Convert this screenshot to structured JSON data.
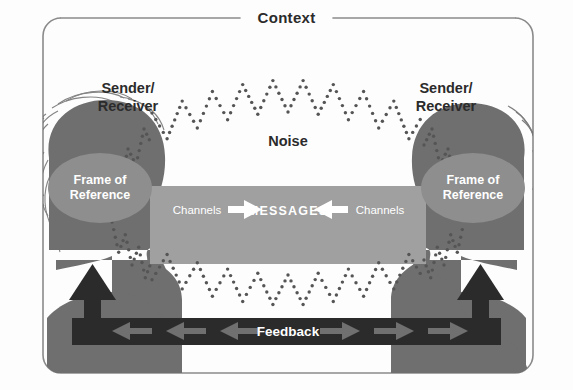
{
  "diagram": {
    "type": "communication-model"
  },
  "frame": {
    "context_label": "Context",
    "border_color": "#8a8a8a",
    "background_color": "#fdfdfd"
  },
  "left_person": {
    "role_label_line1": "Sender/",
    "role_label_line2": "Receiver",
    "frame_of_reference_line1": "Frame of",
    "frame_of_reference_line2": "Reference",
    "silhouette_color": "#6f6f6f",
    "ellipse_color": "#8e8e8e",
    "gender_hint": "long-hair-figure"
  },
  "right_person": {
    "role_label_line1": "Sender/",
    "role_label_line2": "Receiver",
    "frame_of_reference_line1": "Frame of",
    "frame_of_reference_line2": "Reference",
    "silhouette_color": "#6f6f6f",
    "ellipse_color": "#8e8e8e",
    "gender_hint": "short-hair-figure"
  },
  "noise": {
    "label": "Noise",
    "dot_color": "#555555",
    "pattern": "dotted-zigzag-wave"
  },
  "message_band": {
    "center_label": "MESSAGES",
    "left_channel_label": "Channels",
    "right_channel_label": "Channels",
    "band_color": "#a0a0a0",
    "text_color": "#ffffff",
    "left_arrow_direction": "right",
    "right_arrow_direction": "left"
  },
  "feedback": {
    "label": "Feedback",
    "bar_color": "#2b2b2b",
    "text_color": "#ffffff",
    "arrow_color": "#6f6f6f",
    "left_arrow_count": 3,
    "right_arrow_count": 3,
    "riser_direction": "up"
  }
}
